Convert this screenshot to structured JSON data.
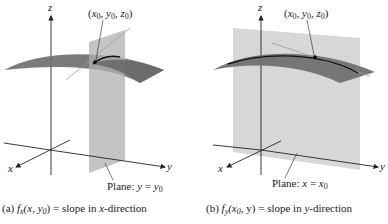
{
  "figure": {
    "panels": [
      {
        "id": "a",
        "axis_labels": {
          "x": "x",
          "y": "y",
          "z": "z"
        },
        "point_label": {
          "open": "(",
          "x": "x",
          "y": "y",
          "z": "z",
          "sub": "0",
          "close": ")"
        },
        "plane_label": {
          "prefix": "Plane: ",
          "var": "y",
          "eq": " = ",
          "val": "y",
          "sub": "0"
        },
        "caption": {
          "tag": "(a)",
          "func": "f",
          "func_sub": "x",
          "args": "(x, y",
          "args_sub": "0",
          "args_close": ")",
          "rest": " = slope in ",
          "dir": "x",
          "dir_rest": "-direction"
        }
      },
      {
        "id": "b",
        "axis_labels": {
          "x": "x",
          "y": "y",
          "z": "z"
        },
        "point_label": {
          "open": "(",
          "x": "x",
          "y": "y",
          "z": "z",
          "sub": "0",
          "close": ")"
        },
        "plane_label": {
          "prefix": "Plane: ",
          "var": "x",
          "eq": " = ",
          "val": "x",
          "sub": "0"
        },
        "caption": {
          "tag": "(b)",
          "func": "f",
          "func_sub": "y",
          "args": "(x",
          "args_sub": "0",
          "args_close": ", y)",
          "rest": " = slope in ",
          "dir": "y",
          "dir_rest": "-direction"
        }
      }
    ],
    "colors": {
      "surface": "#6f6f6f",
      "surface_light": "#8a8a8a",
      "plane": "#b5b5b5",
      "axis": "#222222",
      "tangent": "#9a9a9a",
      "curve": "#111111"
    }
  }
}
